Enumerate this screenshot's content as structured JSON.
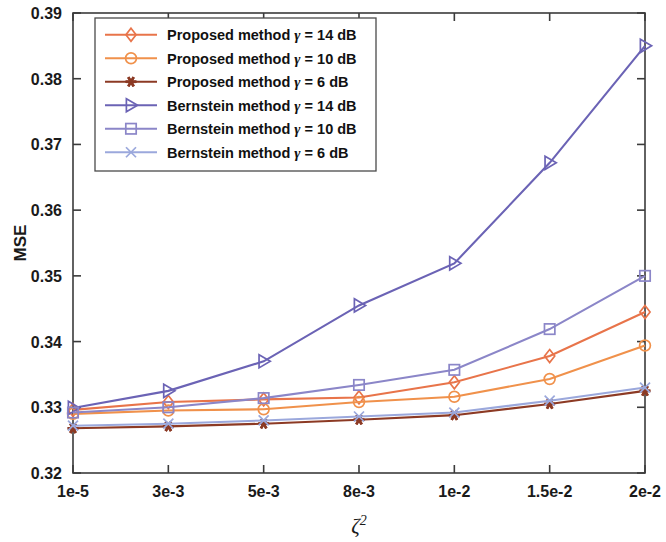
{
  "chart_data": {
    "type": "line",
    "title": "",
    "xlabel": "ζ²",
    "ylabel": "MSE",
    "x_tick_labels": [
      "1e-5",
      "3e-3",
      "5e-3",
      "8e-3",
      "1e-2",
      "1.5e-2",
      "2e-2"
    ],
    "x_positions": [
      0,
      1,
      2,
      3,
      4,
      5,
      6
    ],
    "y_tick_labels": [
      "0.32",
      "0.33",
      "0.34",
      "0.35",
      "0.36",
      "0.37",
      "0.38",
      "0.39"
    ],
    "ylim": [
      0.32,
      0.39
    ],
    "xlim": [
      0,
      6
    ],
    "grid": false,
    "legend_position": "upper left",
    "series": [
      {
        "name": "Proposed method γ = 14 dB",
        "label_prefix": "Proposed method",
        "label_gamma": "γ",
        "label_suffix": "= 14 dB",
        "color": "#E8744A",
        "marker": "diamond",
        "values": [
          0.3296,
          0.3308,
          0.3312,
          0.3315,
          0.3338,
          0.3378,
          0.3445
        ]
      },
      {
        "name": "Proposed method γ = 10 dB",
        "label_prefix": "Proposed method",
        "label_gamma": "γ",
        "label_suffix": "= 10 dB",
        "color": "#F0914B",
        "marker": "circle",
        "values": [
          0.329,
          0.3295,
          0.3297,
          0.3308,
          0.3316,
          0.3343,
          0.3394
        ]
      },
      {
        "name": "Proposed method γ = 6 dB",
        "label_prefix": "Proposed method",
        "label_gamma": "γ",
        "label_suffix": "= 6 dB",
        "color": "#8C3A24",
        "marker": "star",
        "values": [
          0.3268,
          0.3271,
          0.3275,
          0.3281,
          0.3288,
          0.3305,
          0.3325
        ]
      },
      {
        "name": "Bernstein method γ = 14 dB",
        "label_prefix": "Bernstein method",
        "label_gamma": "γ",
        "label_suffix": "= 14 dB",
        "color": "#6B63B5",
        "marker": "triangle-right",
        "values": [
          0.3299,
          0.3325,
          0.337,
          0.3455,
          0.3519,
          0.3672,
          0.385
        ]
      },
      {
        "name": "Bernstein method γ = 10 dB",
        "label_prefix": "Bernstein method",
        "label_gamma": "γ",
        "label_suffix": "= 10 dB",
        "color": "#8B86C8",
        "marker": "square",
        "values": [
          0.3292,
          0.33,
          0.3314,
          0.3334,
          0.3357,
          0.3419,
          0.35
        ]
      },
      {
        "name": "Bernstein method γ = 6 dB",
        "label_prefix": "Bernstein method",
        "label_gamma": "γ",
        "label_suffix": "= 6 dB",
        "color": "#9BA8DC",
        "marker": "x-thin",
        "values": [
          0.3272,
          0.3275,
          0.328,
          0.3286,
          0.3292,
          0.331,
          0.333
        ]
      }
    ]
  }
}
